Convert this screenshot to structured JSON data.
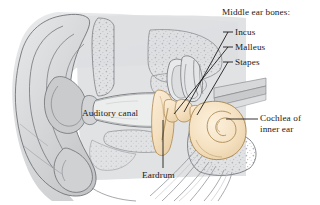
{
  "figure": {
    "background_color": "#ffffff"
  },
  "palette": {
    "tissue_gray": "#d9dadb",
    "tissue_gray_light": "#e4e5e6",
    "tissue_gray_dark": "#c6c8c9",
    "bone_tan": "#f6e2c3",
    "bone_tan_shadow": "#e9d0a8",
    "outline": "#5a5d60",
    "leader_line": "#111111",
    "label_text": "#1a1a1a",
    "stipple": "#b9bcbf"
  },
  "labels": {
    "middle_ear_bones_heading": "Middle ear bones:",
    "incus": "Incus",
    "malleus": "Malleus",
    "stapes": "Stapes",
    "auditory_canal": "Auditory canal",
    "eardrum": "Eardrum",
    "cochlea_line1": "Cochlea of",
    "cochlea_line2": "inner ear"
  },
  "parts": [
    {
      "name": "pinna",
      "label": "",
      "fill": "#d9dadb"
    },
    {
      "name": "auditory-canal",
      "label": "Auditory canal",
      "fill": "#e4e5e6"
    },
    {
      "name": "eardrum",
      "label": "Eardrum",
      "fill": "#f6e2c3"
    },
    {
      "name": "malleus",
      "label": "Malleus",
      "fill": "#f6e2c3"
    },
    {
      "name": "incus",
      "label": "Incus",
      "fill": "#f6e2c3"
    },
    {
      "name": "stapes",
      "label": "Stapes",
      "fill": "#f6e2c3"
    },
    {
      "name": "cochlea",
      "label": "Cochlea of inner ear",
      "fill": "#f6e2c3"
    },
    {
      "name": "semicircular-canals",
      "label": "",
      "fill": "#e4e5e6"
    },
    {
      "name": "auditory-nerve",
      "label": "",
      "fill": "#cfd1d3"
    }
  ]
}
